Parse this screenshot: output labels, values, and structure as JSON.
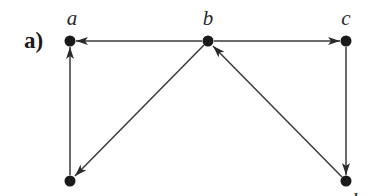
{
  "figure": {
    "panel_label": "a)",
    "colors": {
      "edge": "#3a3a3a",
      "node": "#1a1a1a",
      "background": "#ffffff"
    },
    "nodes": [
      {
        "id": "a",
        "label": "a",
        "x": 70,
        "y": 41
      },
      {
        "id": "b",
        "label": "b",
        "x": 208,
        "y": 41
      },
      {
        "id": "c",
        "label": "c",
        "x": 346,
        "y": 41
      },
      {
        "id": "d",
        "label": "d",
        "x": 346,
        "y": 181
      },
      {
        "id": "e",
        "label": "",
        "x": 70,
        "y": 181
      }
    ],
    "edges": [
      {
        "from": "b",
        "to": "a"
      },
      {
        "from": "b",
        "to": "c"
      },
      {
        "from": "b",
        "to": "e"
      },
      {
        "from": "c",
        "to": "d"
      },
      {
        "from": "d",
        "to": "b"
      },
      {
        "from": "e",
        "to": "a"
      }
    ]
  }
}
